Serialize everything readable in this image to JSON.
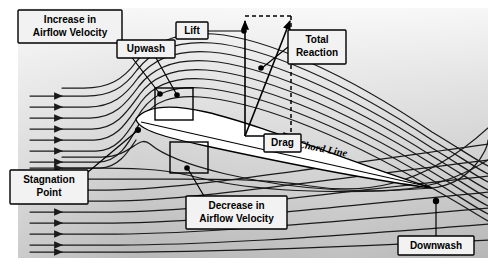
{
  "figure": {
    "background": {
      "frame_fill_top": "#f6f6f6",
      "frame_fill_bottom": "#b9b9b9",
      "page_background": "#ffffff",
      "frame_rect": {
        "x": 18,
        "y": 8,
        "width": 470,
        "height": 250
      }
    },
    "line_color": "#1a1a1a",
    "callout_fill": "#f2f2f2",
    "callout_stroke": "#000000"
  },
  "callouts": [
    {
      "id": "increase-velocity",
      "lines": [
        "Increase in",
        "Airflow Velocity"
      ],
      "box": {
        "x": 18,
        "y": 10,
        "width": 104,
        "height": 33
      },
      "font_size": 10,
      "leader": {
        "x1": 122,
        "y1": 43,
        "x2": 160,
        "y2": 94
      },
      "anchor_dot": {
        "x": 160,
        "y": 94,
        "r": 2.6
      }
    },
    {
      "id": "upwash",
      "lines": [
        "Upwash"
      ],
      "box": {
        "x": 117,
        "y": 40,
        "width": 58,
        "height": 18
      },
      "font_size": 10,
      "leader": {
        "x1": 158,
        "y1": 58,
        "x2": 176,
        "y2": 95
      },
      "anchor_dot": {
        "x": 176,
        "y": 95,
        "r": 2.6
      }
    },
    {
      "id": "lift",
      "lines": [
        "Lift"
      ],
      "box": {
        "x": 176,
        "y": 22,
        "width": 32,
        "height": 17
      },
      "font_size": 10,
      "leader": {
        "x1": 208,
        "y1": 31,
        "x2": 243,
        "y2": 31
      },
      "anchor_dot": {
        "x": 243,
        "y": 31,
        "r": 2.6
      }
    },
    {
      "id": "total-reaction",
      "lines": [
        "Total",
        "Reaction"
      ],
      "box": {
        "x": 288,
        "y": 30,
        "width": 58,
        "height": 34
      },
      "font_size": 10,
      "leader": {
        "x1": 288,
        "y1": 47,
        "x2": 262,
        "y2": 68
      },
      "anchor_dot": {
        "x": 262,
        "y": 68,
        "r": 2.6
      }
    },
    {
      "id": "drag",
      "lines": [
        "Drag"
      ],
      "box": {
        "x": 264,
        "y": 134,
        "width": 37,
        "height": 18
      },
      "font_size": 10,
      "leader": null,
      "anchor_dot": null
    },
    {
      "id": "stagnation-point",
      "lines": [
        "Stagnation",
        "Point"
      ],
      "box": {
        "x": 10,
        "y": 170,
        "width": 78,
        "height": 34
      },
      "font_size": 10,
      "leader": {
        "x1": 88,
        "y1": 170,
        "x2": 137,
        "y2": 130
      },
      "anchor_dot": {
        "x": 137,
        "y": 130,
        "r": 2.8
      }
    },
    {
      "id": "decrease-velocity",
      "lines": [
        "Decrease in",
        "Airflow Velocity"
      ],
      "box": {
        "x": 186,
        "y": 196,
        "width": 101,
        "height": 33
      },
      "font_size": 10,
      "leader": {
        "x1": 203,
        "y1": 196,
        "x2": 187,
        "y2": 168
      },
      "anchor_dot": {
        "x": 187,
        "y": 168,
        "r": 2.6
      }
    },
    {
      "id": "downwash",
      "lines": [
        "Downwash"
      ],
      "box": {
        "x": 398,
        "y": 236,
        "width": 76,
        "height": 19
      },
      "font_size": 10,
      "leader": {
        "x1": 436,
        "y1": 236,
        "x2": 436,
        "y2": 201
      },
      "anchor_dot": {
        "x": 436,
        "y": 201,
        "r": 3.0
      }
    }
  ],
  "chord_label": {
    "text": "Chord Line",
    "x": 322,
    "y": 152,
    "rotation": 11,
    "font_size": 10.5
  },
  "vectors": {
    "origin": {
      "x": 245,
      "y": 136
    },
    "lift": {
      "label": "Lift",
      "tip": {
        "x": 245,
        "y": 21
      },
      "direction": "up"
    },
    "drag": {
      "label": "Drag",
      "tip": {
        "x": 292,
        "y": 136
      },
      "direction": "right"
    },
    "total_reaction": {
      "label": "Total Reaction",
      "tip": {
        "x": 290,
        "y": 21
      },
      "direction": "up-right"
    },
    "dashed_guides": [
      {
        "x1": 245,
        "y1": 16,
        "x2": 291,
        "y2": 16
      },
      {
        "x1": 291,
        "y1": 16,
        "x2": 291,
        "y2": 140
      }
    ]
  },
  "airfoil": {
    "leading_edge": {
      "x": 136,
      "y": 119
    },
    "trailing_edge": {
      "x": 432,
      "y": 188
    },
    "fill": "#ffffff",
    "stroke": "#000000",
    "angle_of_attack_note": "positive, chord inclined downward to the right"
  },
  "inset_boxes": [
    {
      "id": "upper-surface-inset",
      "x": 155,
      "y": 88,
      "width": 38,
      "height": 32
    },
    {
      "id": "lower-surface-inset",
      "x": 170,
      "y": 142,
      "width": 38,
      "height": 31
    }
  ],
  "inflow_arrows": {
    "count": 13,
    "x_start": 30,
    "x_end": 66,
    "rows_upper": [
      96,
      107,
      118,
      129,
      140,
      151,
      162,
      168
    ],
    "rows_lower": [
      212,
      223,
      234,
      245,
      252
    ],
    "note": "uniform freestream arrows entering from the left edge"
  },
  "streamlines": {
    "upper_count": 8,
    "lower_count": 9,
    "description": "streamlines bend upward ahead of the leading edge (upwash), compress and accelerate over the upper surface, and deflect downward behind the trailing edge (downwash)"
  }
}
